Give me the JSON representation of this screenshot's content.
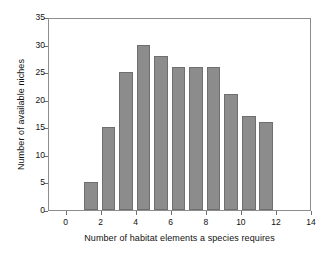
{
  "chart_data": {
    "type": "bar",
    "title": "",
    "subtitle": "",
    "xlabel": "Number of habitat elements a species requires",
    "ylabel": "Number of available niches",
    "categories": [
      1,
      2,
      3,
      4,
      5,
      6,
      7,
      8,
      9,
      10,
      11
    ],
    "values": [
      5,
      15,
      25,
      30,
      28,
      26,
      26,
      26,
      21,
      17,
      16
    ],
    "series": [
      {
        "name": "Available niches",
        "values": [
          5,
          15,
          25,
          30,
          28,
          26,
          26,
          26,
          21,
          17,
          16
        ]
      }
    ],
    "xlim": [
      -1,
      14
    ],
    "ylim": [
      0,
      35
    ],
    "xticks": [
      0,
      2,
      4,
      6,
      8,
      10,
      12,
      14
    ],
    "xtick_labels": [
      "0",
      "2",
      "4",
      "6",
      "8",
      "10",
      "12",
      "14"
    ],
    "yticks": [
      0,
      5,
      10,
      15,
      20,
      25,
      30,
      35
    ],
    "ytick_labels": [
      "0",
      "5",
      "10",
      "15",
      "20",
      "25",
      "30",
      "35"
    ],
    "grid": false,
    "legend": null,
    "legend_position": "none",
    "bar_width": 0.78,
    "bar_color": "#8c8c8c",
    "bar_edge_color": "#6f6f6f",
    "frame_color": "#8d8d8d",
    "background_color": "#ffffff",
    "annotations": []
  }
}
